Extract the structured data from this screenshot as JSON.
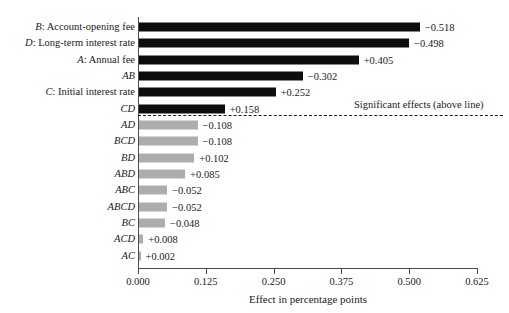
{
  "chart_data": {
    "type": "bar",
    "orientation": "horizontal",
    "title": "",
    "xlabel": "Effect in percentage points",
    "ylabel": "",
    "xlim": [
      0.0,
      0.625
    ],
    "xticks": [
      "0.000",
      "0.125",
      "0.250",
      "0.375",
      "0.500",
      "0.625"
    ],
    "xtick_values": [
      0.0,
      0.125,
      0.25,
      0.375,
      0.5,
      0.625
    ],
    "grid": false,
    "legend": null,
    "annotations": [
      {
        "text": "Significant effects (above line)",
        "kind": "divider-note"
      }
    ],
    "divider": {
      "style": "dashed",
      "after_category": "CD",
      "meaning": "effects above the line are statistically significant"
    },
    "colors": {
      "significant": "#0d0d0d",
      "not_significant": "#adadad",
      "axis": "#4a4a4a",
      "text": "#1a1a1a"
    },
    "categories": [
      "B: Account-opening fee",
      "D: Long-term interest rate",
      "A: Annual fee",
      "AB",
      "C: Initial interest rate",
      "CD",
      "AD",
      "BCD",
      "BD",
      "ABD",
      "ABC",
      "ABCD",
      "BC",
      "ACD",
      "AC"
    ],
    "values": [
      0.518,
      0.498,
      0.405,
      0.302,
      0.252,
      0.158,
      0.108,
      0.108,
      0.102,
      0.085,
      0.052,
      0.052,
      0.048,
      0.008,
      0.002
    ],
    "signed_values": [
      -0.518,
      -0.498,
      0.405,
      -0.302,
      0.252,
      0.158,
      -0.108,
      -0.108,
      0.102,
      0.085,
      -0.052,
      -0.052,
      -0.048,
      0.008,
      0.002
    ],
    "value_labels": [
      "−0.518",
      "−0.498",
      "+0.405",
      "−0.302",
      "+0.252",
      "+0.158",
      "−0.108",
      "−0.108",
      "+0.102",
      "+0.085",
      "−0.052",
      "−0.052",
      "−0.048",
      "+0.008",
      "+0.002"
    ],
    "significance": [
      true,
      true,
      true,
      true,
      true,
      true,
      false,
      false,
      false,
      false,
      false,
      false,
      false,
      false,
      false
    ]
  },
  "rows": [
    {
      "code": "B",
      "desc": ": Account-opening fee",
      "value": 0.518,
      "label": "−0.518",
      "significant": true
    },
    {
      "code": "D",
      "desc": ": Long-term interest rate",
      "value": 0.498,
      "label": "−0.498",
      "significant": true
    },
    {
      "code": "A",
      "desc": ": Annual fee",
      "value": 0.405,
      "label": "+0.405",
      "significant": true
    },
    {
      "code": "AB",
      "desc": "",
      "value": 0.302,
      "label": "−0.302",
      "significant": true
    },
    {
      "code": "C",
      "desc": ": Initial interest rate",
      "value": 0.252,
      "label": "+0.252",
      "significant": true
    },
    {
      "code": "CD",
      "desc": "",
      "value": 0.158,
      "label": "+0.158",
      "significant": true
    },
    {
      "code": "AD",
      "desc": "",
      "value": 0.108,
      "label": "−0.108",
      "significant": false
    },
    {
      "code": "BCD",
      "desc": "",
      "value": 0.108,
      "label": "−0.108",
      "significant": false
    },
    {
      "code": "BD",
      "desc": "",
      "value": 0.102,
      "label": "+0.102",
      "significant": false
    },
    {
      "code": "ABD",
      "desc": "",
      "value": 0.085,
      "label": "+0.085",
      "significant": false
    },
    {
      "code": "ABC",
      "desc": "",
      "value": 0.052,
      "label": "−0.052",
      "significant": false
    },
    {
      "code": "ABCD",
      "desc": "",
      "value": 0.052,
      "label": "−0.052",
      "significant": false
    },
    {
      "code": "BC",
      "desc": "",
      "value": 0.048,
      "label": "−0.048",
      "significant": false
    },
    {
      "code": "ACD",
      "desc": "",
      "value": 0.008,
      "label": "+0.008",
      "significant": false
    },
    {
      "code": "AC",
      "desc": "",
      "value": 0.002,
      "label": "+0.002",
      "significant": false
    }
  ],
  "axis": {
    "x_title": "Effect in percentage points",
    "ticks": [
      "0.000",
      "0.125",
      "0.250",
      "0.375",
      "0.500",
      "0.625"
    ]
  },
  "divider_note": "Significant effects (above line)"
}
